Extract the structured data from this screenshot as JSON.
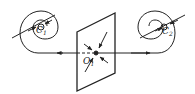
{
  "diagram": {
    "left_source": {
      "label": "C",
      "subscript": "1"
    },
    "right_source": {
      "label": "C",
      "subscript": "2"
    },
    "center_point": {
      "label": "O",
      "subscript": "1"
    },
    "stroke_color": "#222222",
    "background": "#ffffff"
  }
}
